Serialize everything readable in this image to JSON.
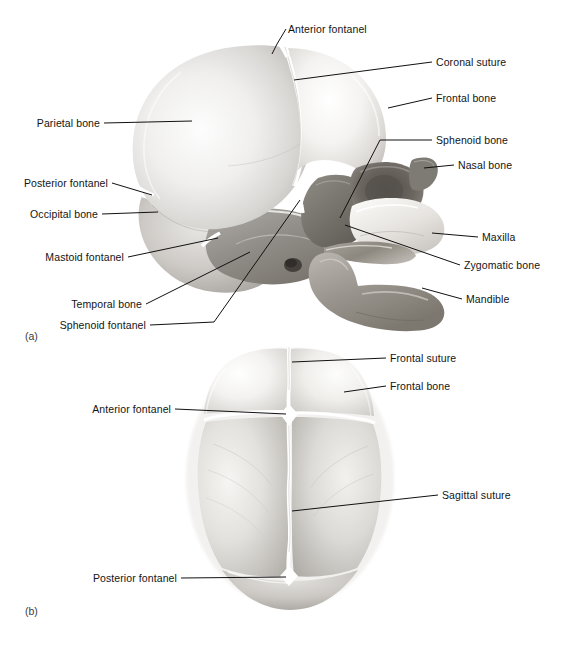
{
  "document": {
    "title": "Fetal Skull Anatomy",
    "background_color": "#ffffff",
    "label_color": "#141414",
    "leader_color": "#111111"
  },
  "panels": [
    {
      "tag": "(a)",
      "view": "lateral view of fetal skull",
      "labels": [
        {
          "id": "a-anterior-fontanel",
          "text": "Anterior fontanel",
          "side": "right"
        },
        {
          "id": "a-coronal-suture",
          "text": "Coronal suture",
          "side": "right"
        },
        {
          "id": "a-frontal-bone",
          "text": "Frontal bone",
          "side": "right"
        },
        {
          "id": "a-sphenoid-bone",
          "text": "Sphenoid bone",
          "side": "right"
        },
        {
          "id": "a-nasal-bone",
          "text": "Nasal bone",
          "side": "right"
        },
        {
          "id": "a-maxilla",
          "text": "Maxilla",
          "side": "right"
        },
        {
          "id": "a-zygomatic-bone",
          "text": "Zygomatic bone",
          "side": "right"
        },
        {
          "id": "a-mandible",
          "text": "Mandible",
          "side": "right"
        },
        {
          "id": "a-parietal-bone",
          "text": "Parietal bone",
          "side": "left"
        },
        {
          "id": "a-posterior-fontanel",
          "text": "Posterior fontanel",
          "side": "left"
        },
        {
          "id": "a-occipital-bone",
          "text": "Occipital bone",
          "side": "left"
        },
        {
          "id": "a-mastoid-fontanel",
          "text": "Mastoid fontanel",
          "side": "left"
        },
        {
          "id": "a-temporal-bone",
          "text": "Temporal bone",
          "side": "left"
        },
        {
          "id": "a-sphenoid-fontanel",
          "text": "Sphenoid fontanel",
          "side": "left"
        }
      ]
    },
    {
      "tag": "(b)",
      "view": "superior view of fetal skull",
      "labels": [
        {
          "id": "b-frontal-suture",
          "text": "Frontal suture",
          "side": "right"
        },
        {
          "id": "b-frontal-bone",
          "text": "Frontal bone",
          "side": "right"
        },
        {
          "id": "b-sagittal-suture",
          "text": "Sagittal suture",
          "side": "right"
        },
        {
          "id": "b-anterior-fontanel",
          "text": "Anterior fontanel",
          "side": "left"
        },
        {
          "id": "b-posterior-fontanel",
          "text": "Posterior fontanel",
          "side": "left"
        }
      ]
    }
  ]
}
